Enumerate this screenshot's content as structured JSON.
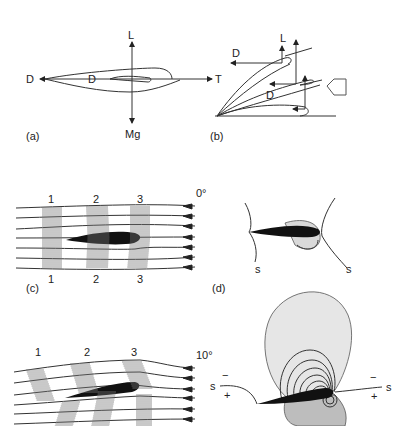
{
  "panels": {
    "a": {
      "label": "(a)",
      "forces": {
        "lift": "L",
        "weight": "Mg",
        "drag_left": "D",
        "drag_inner": "D",
        "thrust": "T"
      }
    },
    "b": {
      "label": "(b)",
      "forces": {
        "lift": "L",
        "drag_top": "D",
        "drag_mid": "D"
      },
      "icon": "airflow-arrow-icon"
    },
    "c": {
      "label": "(c)",
      "angle": "0°",
      "columns_top": [
        "1",
        "2",
        "3"
      ],
      "columns_bottom": [
        "1",
        "2",
        "3"
      ]
    },
    "d": {
      "label": "(d)",
      "stagnation_left": "s",
      "stagnation_right": "s"
    },
    "e": {
      "angle": "10°",
      "columns_top": [
        "1",
        "2",
        "3"
      ]
    },
    "f": {
      "stagnation_left": "s",
      "stagnation_right": "s",
      "minus_left": "−",
      "plus_left": "+",
      "minus_right": "−",
      "plus_right": "+"
    }
  },
  "colors": {
    "ink": "#222222",
    "light_fill": "#e4e4e4",
    "dark_fill": "#bdbdbd",
    "airfoil": "#111111"
  }
}
